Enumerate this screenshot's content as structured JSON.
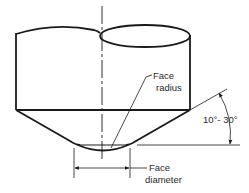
{
  "diagram": {
    "labels": {
      "face_radius_line1": "Face",
      "face_radius_line2": "radius",
      "face_diameter_line1": "Face",
      "face_diameter_line2": "diameter",
      "angle_range": "10°- 30°"
    },
    "colors": {
      "stroke": "#1a1a1a",
      "text": "#2a2a2a",
      "background": "#ffffff"
    }
  }
}
